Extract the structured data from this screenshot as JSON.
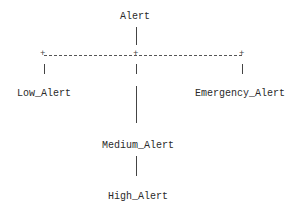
{
  "diagram": {
    "type": "ascii-tree",
    "root": {
      "label": "Alert"
    },
    "children": [
      {
        "label": "Low_Alert"
      },
      {
        "label": "Medium_Alert",
        "children": [
          {
            "label": "High_Alert"
          }
        ]
      },
      {
        "label": "Emergency_Alert"
      }
    ],
    "connector_glyphs": {
      "junction": "+",
      "vertical": "|",
      "horizontal": "-"
    }
  }
}
